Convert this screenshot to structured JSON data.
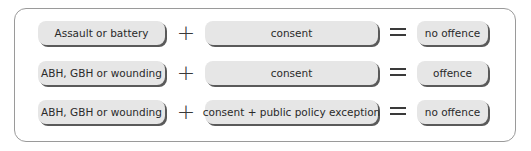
{
  "diagram": {
    "rows": [
      {
        "left": "Assault or battery",
        "operator1": "+",
        "middle": "consent",
        "operator2": "=",
        "result": "no offence"
      },
      {
        "left": "ABH, GBH or wounding",
        "operator1": "+",
        "middle": "consent",
        "operator2": "=",
        "result": "offence"
      },
      {
        "left": "ABH, GBH or wounding",
        "operator1": "+",
        "middle": "consent + public policy exception",
        "operator2": "=",
        "result": "no offence"
      }
    ],
    "colors": {
      "pill_fill": "#e6e6e6",
      "pill_shadow": "#5a5a5a",
      "frame_border": "#9a9a9a",
      "text": "#2a2a2a"
    }
  }
}
